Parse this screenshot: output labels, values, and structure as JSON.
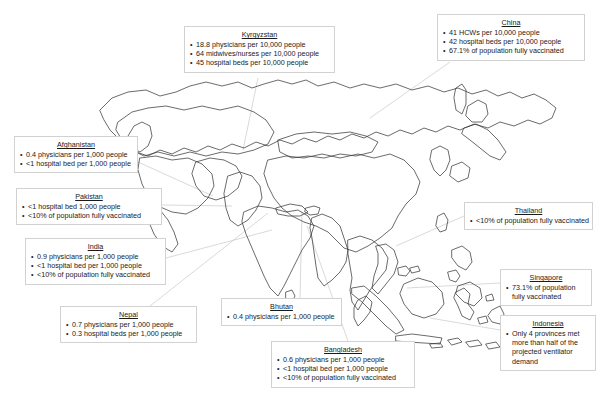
{
  "figure": {
    "type": "annotated-map",
    "region": "Asia",
    "background_color": "#ffffff",
    "outline_color": "#3a3a3a",
    "leader_line_color": "#c9c9c9",
    "box_border_color": "#d2d2d2",
    "text_color": "#1a1a1a"
  },
  "callouts": [
    {
      "id": "kyrgyzstan",
      "title": "Kyrgyzstan",
      "items": [
        "18.8 physicians per 10,000 people",
        "64 midwives/nurses per 10,000 people",
        "45 hospital beds per 10,000 people"
      ]
    },
    {
      "id": "china",
      "title": "China",
      "items": [
        "41 HCWs per 10,000 people",
        "42 hospital beds per 10,000 people",
        "67.1% of population fully vaccinated"
      ]
    },
    {
      "id": "afghanistan",
      "title": "Afghanistan",
      "items": [
        "0.4 physicians per 1,000 people",
        "<1 hospital bed per 1,000 people"
      ]
    },
    {
      "id": "pakistan",
      "title": "Pakistan",
      "items": [
        "<1 hospital bed 1,000 people",
        "<10% of population fully vaccinated"
      ]
    },
    {
      "id": "india",
      "title": "India",
      "items": [
        "0.9 physicians per 1,000 people",
        "<1 hospital bed per 1,000 people",
        "<10% of population fully vaccinated"
      ]
    },
    {
      "id": "nepal",
      "title": "Nepal",
      "items": [
        "0.7 physicians per 1,000 people",
        "0.3 hospital beds per 1,000 people"
      ]
    },
    {
      "id": "bhutan",
      "title": "Bhutan",
      "items": [
        "0.4 physicians per 1,000 people"
      ]
    },
    {
      "id": "bangladesh",
      "title": "Bangladesh",
      "items": [
        "0.6 physicians per 1,000 people",
        "<1 hospital bed per 1,000 people",
        "<10% of population fully vaccinated"
      ]
    },
    {
      "id": "thailand",
      "title": "Thailand",
      "items": [
        "<10% of population fully vaccinated"
      ]
    },
    {
      "id": "singapore",
      "title": "Singapore",
      "items": [
        "73.1% of population fully vaccinated"
      ]
    },
    {
      "id": "indonesia",
      "title": "Indonesia",
      "items": [
        "Only 4 provinces met more than half of the projected ventilator demand"
      ]
    }
  ]
}
